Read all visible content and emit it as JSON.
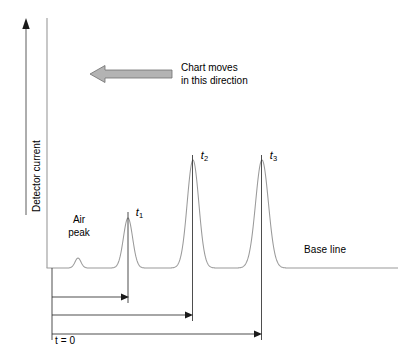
{
  "figure": {
    "type": "chromatogram-diagram",
    "background_color": "#ffffff",
    "line_color": "#8c8c8c",
    "axis_color": "#808080",
    "annotation_color": "#000000",
    "arrow_fill_color": "#b3b3b3",
    "arrow_stroke_color": "#6e6e6e"
  },
  "axes": {
    "y_label": "Detector current",
    "y_arrow_direction": "up",
    "origin_label": "t = 0"
  },
  "annotations": {
    "chart_moves_line1": "Chart moves",
    "chart_moves_line2": "in this direction",
    "air_peak_line1": "Air",
    "air_peak_line2": "peak",
    "base_line": "Base line"
  },
  "peaks": [
    {
      "id": "air-peak",
      "label": "",
      "center_x": 78,
      "height": 10,
      "width": 7
    },
    {
      "id": "peak-t1",
      "label": "t",
      "subscript": "1",
      "center_x": 128,
      "height": 50,
      "width": 10
    },
    {
      "id": "peak-t2",
      "label": "t",
      "subscript": "2",
      "center_x": 193,
      "height": 108,
      "width": 13
    },
    {
      "id": "peak-t3",
      "label": "t",
      "subscript": "3",
      "center_x": 262,
      "height": 108,
      "width": 14
    }
  ],
  "retention_arrows": [
    {
      "id": "retention-t1",
      "from_x": 52,
      "to_x": 128,
      "y": 297
    },
    {
      "id": "retention-t2",
      "from_x": 52,
      "to_x": 192,
      "y": 315
    },
    {
      "id": "retention-t3",
      "from_x": 52,
      "to_x": 262,
      "y": 334
    }
  ],
  "chart_data": {
    "type": "line",
    "title": "",
    "xlabel": "",
    "ylabel": "Detector current",
    "baseline_y_px": 268,
    "x_axis_start_px": 47,
    "x_axis_end_px": 398,
    "series": [
      {
        "name": "Detector signal",
        "peaks": [
          {
            "name": "Air peak",
            "retention_time_label": "",
            "center_px": 78,
            "height_px": 10,
            "sigma_px": 3.0
          },
          {
            "name": "Component 1",
            "retention_time_label": "t1",
            "center_px": 128,
            "height_px": 50,
            "sigma_px": 4.6
          },
          {
            "name": "Component 2",
            "retention_time_label": "t2",
            "center_px": 193,
            "height_px": 108,
            "sigma_px": 5.8
          },
          {
            "name": "Component 3",
            "retention_time_label": "t3",
            "center_px": 262,
            "height_px": 108,
            "sigma_px": 6.4
          }
        ]
      }
    ],
    "legend": [],
    "grid": false
  }
}
